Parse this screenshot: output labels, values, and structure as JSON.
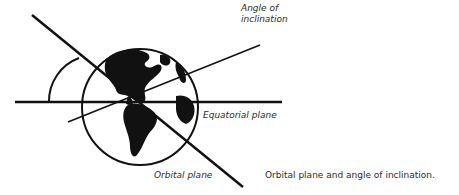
{
  "diagram": {
    "labels": {
      "angle_of_inclination_line1": "Angle of",
      "angle_of_inclination_line2": "inclination",
      "equatorial_plane": "Equatorial plane",
      "orbital_plane": "Orbital plane"
    },
    "caption": "Orbital plane and angle of inclination.",
    "elements": [
      "earth-globe",
      "equatorial-plane-line",
      "orbital-plane-line",
      "inclination-arc",
      "pointer-line"
    ],
    "colors": {
      "ink": "#111111",
      "background": "#ffffff"
    }
  }
}
